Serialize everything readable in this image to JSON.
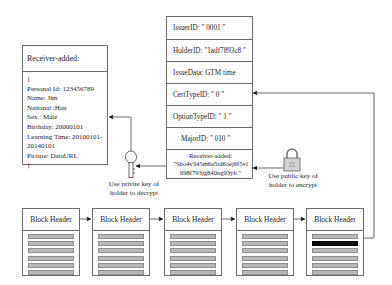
{
  "receiver_box": {
    "title": "Receiver-added:",
    "lines": [
      "{",
      "Personal Id: 123456789",
      "Name: Jim",
      "National :Han",
      "Sex : Male",
      "Birthday: 20000101",
      "Learning Time: 20100101-",
      "20140101",
      "Picture: DataURL",
      "}"
    ]
  },
  "certificate_box": {
    "rows": [
      "IssuerID: \" 0001 \"",
      "HolderID: \"1adf7893c8 \"",
      "IssueData: GTM time",
      "CertTypeID:   \" 0 \"",
      "OptionTypeID: \" 1 \"",
      "MajorID:  \" 010 \""
    ],
    "receiver_row": {
      "label": "Receiver-added:",
      "value_line1": "\"Sho4v345m6a5td6oej6f5vi",
      "value_line2": "698f793jg840ng93yh \""
    }
  },
  "private_key_caption": {
    "line1": "Use  privite key of",
    "line2": "holder to decrypt"
  },
  "public_key_caption": {
    "line1": "Use  public key of",
    "line2": "holder to encrypt"
  },
  "icons": {
    "private_key": "key-icon",
    "public_key": "lock-icon"
  },
  "blockchain": {
    "blocks": [
      {
        "header": "Block Header",
        "highlighted_bar": null
      },
      {
        "header": "Block Header",
        "highlighted_bar": null
      },
      {
        "header": "Block Header",
        "highlighted_bar": null
      },
      {
        "header": "Block Header",
        "highlighted_bar": null
      },
      {
        "header": "Block Header",
        "highlighted_bar": 1
      }
    ],
    "bars_per_block": 6
  },
  "colors": {
    "line": "#4a4a4a",
    "bar_fill": "#b9b9b9",
    "bar_highlight": "#0d0d0d"
  }
}
